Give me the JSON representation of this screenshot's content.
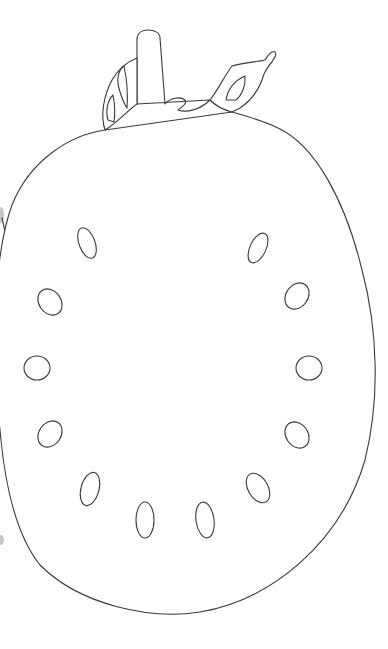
{
  "image": {
    "subject": "tomato cross-section line drawing",
    "style": "black outline coloring page",
    "colors": {
      "background": "#ffffff",
      "stroke": "#3a3a3a",
      "edge_smudge": "#9a9a9a"
    }
  },
  "drawing": {
    "parts": [
      {
        "name": "tomato-outline",
        "label": "Tomato outline"
      },
      {
        "name": "stem",
        "label": "Stem"
      },
      {
        "name": "left-leaf",
        "label": "Left sepal"
      },
      {
        "name": "right-leaf",
        "label": "Right sepal"
      },
      {
        "name": "left-edge-curve",
        "label": "Left edge partial outline"
      }
    ],
    "seed_count": 14,
    "seeds": [
      {
        "cx": 87,
        "cy": 243,
        "rx": 8,
        "ry": 16,
        "rot": -20
      },
      {
        "cx": 258,
        "cy": 248,
        "rx": 8,
        "ry": 16,
        "rot": 25
      },
      {
        "cx": 50,
        "cy": 302,
        "rx": 11,
        "ry": 14,
        "rot": -35
      },
      {
        "cx": 297,
        "cy": 296,
        "rx": 11,
        "ry": 14,
        "rot": 35
      },
      {
        "cx": 37,
        "cy": 368,
        "rx": 13,
        "ry": 12,
        "rot": 0
      },
      {
        "cx": 309,
        "cy": 368,
        "rx": 13,
        "ry": 12,
        "rot": 0
      },
      {
        "cx": 50,
        "cy": 434,
        "rx": 11,
        "ry": 14,
        "rot": 35
      },
      {
        "cx": 297,
        "cy": 435,
        "rx": 11,
        "ry": 14,
        "rot": -35
      },
      {
        "cx": 90,
        "cy": 489,
        "rx": 9,
        "ry": 17,
        "rot": 15
      },
      {
        "cx": 258,
        "cy": 488,
        "rx": 10,
        "ry": 16,
        "rot": -30
      },
      {
        "cx": 145,
        "cy": 520,
        "rx": 9,
        "ry": 18,
        "rot": 0
      },
      {
        "cx": 205,
        "cy": 520,
        "rx": 9,
        "ry": 18,
        "rot": -8
      }
    ]
  }
}
